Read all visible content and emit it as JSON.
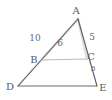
{
  "figure": {
    "type": "geometry-diagram",
    "shape": "triangle-with-parallel-segment",
    "colors": {
      "background": "#ffffff",
      "stroke_dark": "#4f4f4f",
      "stroke_light": "#b9b9b9",
      "stroke_faint": "#d8d8d8",
      "label_text": "#5a5a5a",
      "length_text": "#6a6a6a"
    },
    "vertices": [
      {
        "id": "A",
        "label": "A",
        "x": 78,
        "y": 19,
        "label_x": 76,
        "label_y": 14
      },
      {
        "id": "B",
        "label": "B",
        "x": 41,
        "y": 60,
        "label_x": 30,
        "label_y": 63
      },
      {
        "id": "C",
        "label": "C",
        "x": 87,
        "y": 59,
        "label_x": 88,
        "label_y": 60
      },
      {
        "id": "D",
        "label": "D",
        "x": 18,
        "y": 86,
        "label_x": 6,
        "label_y": 90
      },
      {
        "id": "E",
        "label": "E",
        "x": 97,
        "y": 86,
        "label_x": 99,
        "label_y": 91
      }
    ],
    "segments": [
      {
        "id": "AD",
        "from": "A",
        "to": "D",
        "style": "solid-dark"
      },
      {
        "id": "AE",
        "from": "A",
        "to": "E",
        "style": "solid-dark"
      },
      {
        "id": "DE",
        "from": "D",
        "to": "E",
        "style": "solid-dark"
      },
      {
        "id": "BC",
        "from": "B",
        "to": "C",
        "style": "solid-light"
      },
      {
        "id": "AB-highlight",
        "from": "A",
        "to": "B",
        "style": "faint"
      },
      {
        "id": "AC-highlight",
        "from": "A",
        "to": "C",
        "style": "faint"
      }
    ],
    "measure_labels": [
      {
        "id": "len-10",
        "text": "10",
        "on_segment": "DB",
        "x": 30,
        "y": 41
      },
      {
        "id": "len-6",
        "text": "6",
        "on_segment": "AB",
        "x": 58,
        "y": 46
      },
      {
        "id": "len-5",
        "text": "5",
        "on_segment": "AC",
        "x": 89,
        "y": 40
      },
      {
        "id": "len-3",
        "text": "3",
        "on_segment": "CE",
        "x": 90,
        "y": 70
      }
    ]
  }
}
